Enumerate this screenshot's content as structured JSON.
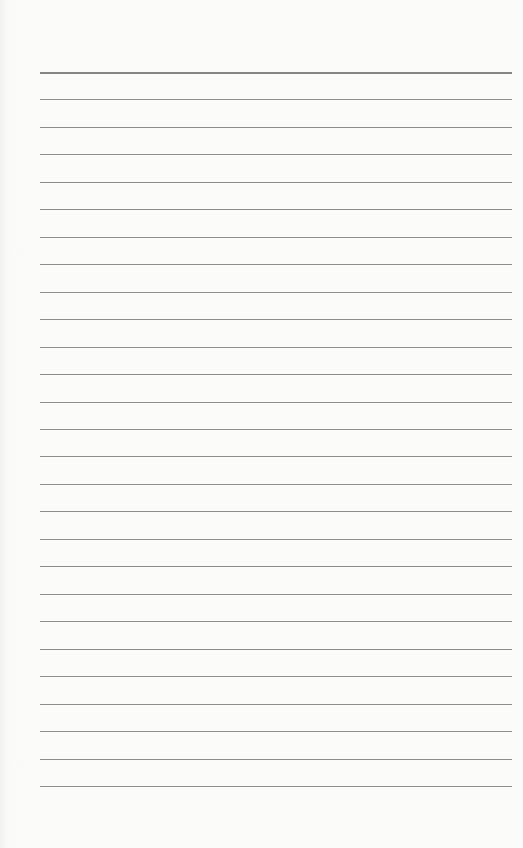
{
  "page": {
    "type": "lined-paper",
    "background_color": "#fbfbfa",
    "rule_color": "#8e8e8e",
    "rule_count": 27,
    "first_rule_y": 72,
    "rule_spacing": 27.46,
    "rule_left": 40,
    "rule_right": 512,
    "text": ""
  }
}
